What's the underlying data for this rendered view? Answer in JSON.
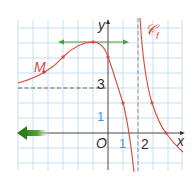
{
  "diagram": {
    "axes": {
      "x_label": "x",
      "y_label": "y",
      "origin_label": "O",
      "x_tick_1": "1",
      "x_tick_2": "2",
      "y_tick_1": "1",
      "y_tick_3": "3"
    },
    "curve": {
      "name": "𝒞",
      "subscript": "f",
      "color": "#d9493a"
    },
    "point_M": {
      "label": "M",
      "x": -4.3,
      "y": 4.1
    },
    "asymptotes": {
      "vertical_x": 2,
      "horizontal_left_y": 3
    },
    "marked_points": [
      {
        "x": -1,
        "y": 6
      },
      {
        "x": -3,
        "y": 5
      },
      {
        "x": 0,
        "y": 5
      },
      {
        "x": 1,
        "y": 2
      },
      {
        "x": 3,
        "y": 2
      },
      {
        "x": 4,
        "y": 0
      }
    ],
    "tangent": {
      "at_x": -1,
      "y": 6,
      "color": "#4f9a3a"
    },
    "limit_arrow": {
      "direction": "left",
      "color": "#3f8c2c"
    },
    "colors": {
      "grid": "#b9d7ee",
      "axis": "#333333",
      "dashed": "#555555",
      "tick_label_blue": "#4a9ad4"
    }
  }
}
